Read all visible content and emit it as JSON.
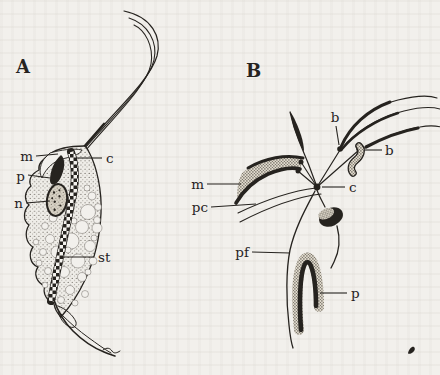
{
  "figure": {
    "kind": "hand-drawn zoological plate, two panels",
    "ink_color": "#26231f",
    "paper_color": "#f2f0ec"
  },
  "panelA": {
    "title": "A",
    "labels": {
      "m": "m",
      "p": "p",
      "n": "n",
      "c": "c",
      "st": "st"
    }
  },
  "panelB": {
    "title": "B",
    "labels": {
      "b_top": "b",
      "b_right": "b",
      "m": "m",
      "pc": "pc",
      "c": "c",
      "pf": "pf",
      "p": "p"
    }
  }
}
